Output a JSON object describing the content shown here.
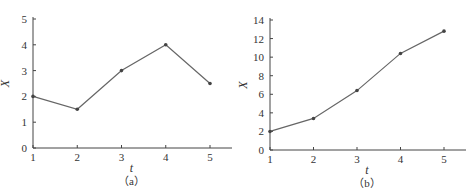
{
  "chart_data": [
    {
      "type": "line",
      "panel": "a",
      "caption": "（a）",
      "title": "",
      "xlabel": "t",
      "ylabel": "X",
      "x": [
        1,
        2,
        3,
        4,
        5
      ],
      "values": [
        2,
        1.5,
        3,
        4,
        2.5
      ],
      "xticks": [
        1,
        2,
        3,
        4,
        5
      ],
      "yticks": [
        0,
        1,
        2,
        3,
        4,
        5
      ],
      "xlim": [
        1,
        5.5
      ],
      "ylim": [
        0,
        5
      ],
      "grid": false,
      "legend": null,
      "markers": true
    },
    {
      "type": "line",
      "panel": "b",
      "caption": "（b）",
      "title": "",
      "xlabel": "t",
      "ylabel": "X",
      "x": [
        1,
        2,
        3,
        4,
        5
      ],
      "values": [
        2,
        3.4,
        6.4,
        10.4,
        12.8
      ],
      "xticks": [
        1,
        2,
        3,
        4,
        5
      ],
      "yticks": [
        0,
        2,
        4,
        6,
        8,
        10,
        12,
        14
      ],
      "xlim": [
        1,
        5.5
      ],
      "ylim": [
        0,
        14
      ],
      "grid": false,
      "legend": null,
      "markers": true
    }
  ],
  "colors": {
    "line": "#666666",
    "marker": "#444444",
    "axis": "#444444",
    "text": "#333333"
  }
}
